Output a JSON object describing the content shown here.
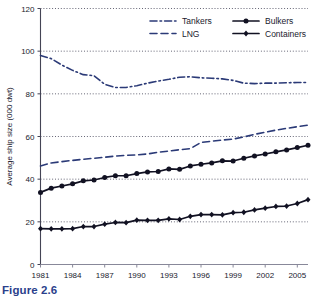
{
  "figure": {
    "caption": "Figure 2.6"
  },
  "chart_data": {
    "type": "line",
    "title": "",
    "subtitle": "",
    "xlabel": "",
    "ylabel": "Average ship size (000 dwt)",
    "ylim": [
      0,
      120
    ],
    "xlim": [
      1981,
      2006
    ],
    "y_ticks": [
      0,
      20,
      40,
      60,
      80,
      100,
      120
    ],
    "x_ticks": [
      1981,
      1984,
      1987,
      1990,
      1993,
      1996,
      1999,
      2002,
      2005
    ],
    "x_tick_labels": [
      "1981",
      "1984",
      "1987",
      "1990",
      "1993",
      "1996",
      "1999",
      "2002",
      "2005"
    ],
    "y_tick_labels": [
      "0",
      "20",
      "40",
      "60",
      "80",
      "100",
      "120"
    ],
    "grid": "horizontal-dotted",
    "legend_position": "top-right",
    "x": [
      1981,
      1982,
      1983,
      1984,
      1985,
      1986,
      1987,
      1988,
      1989,
      1990,
      1991,
      1992,
      1993,
      1994,
      1995,
      1996,
      1997,
      1998,
      1999,
      2000,
      2001,
      2002,
      2003,
      2004,
      2005,
      2006
    ],
    "series": [
      {
        "name": "Tankers",
        "color": "#2b3a77",
        "dash": "dashdot",
        "marker": "none",
        "values": [
          98.0,
          96.5,
          93.5,
          91.0,
          89.0,
          88.5,
          84.5,
          83.0,
          83.0,
          83.8,
          85.0,
          86.0,
          86.8,
          87.8,
          88.0,
          87.5,
          87.3,
          87.0,
          86.3,
          85.0,
          84.8,
          85.0,
          85.0,
          85.2,
          85.3,
          85.3
        ]
      },
      {
        "name": "LNG",
        "color": "#2b3a77",
        "dash": "dashed",
        "marker": "none",
        "values": [
          46.2,
          47.6,
          48.2,
          48.8,
          49.3,
          49.8,
          50.3,
          50.8,
          51.2,
          51.4,
          51.8,
          52.6,
          53.2,
          53.8,
          54.3,
          57.2,
          57.8,
          58.3,
          58.8,
          59.8,
          61.0,
          62.0,
          63.0,
          63.8,
          64.6,
          65.3
        ]
      },
      {
        "name": "Bulkers",
        "color": "#111122",
        "dash": "solid",
        "marker": "circle",
        "values": [
          33.8,
          35.8,
          36.8,
          37.8,
          39.2,
          39.6,
          40.8,
          41.6,
          41.6,
          42.6,
          43.4,
          43.6,
          44.8,
          44.6,
          46.2,
          47.0,
          47.6,
          48.6,
          48.5,
          49.8,
          50.9,
          51.8,
          52.8,
          53.7,
          54.8,
          55.9
        ]
      },
      {
        "name": "Containers",
        "color": "#111122",
        "dash": "solid",
        "marker": "diamond",
        "values": [
          16.8,
          16.7,
          16.7,
          16.8,
          17.8,
          17.8,
          18.9,
          19.7,
          19.6,
          20.8,
          20.7,
          20.7,
          21.4,
          21.1,
          22.6,
          23.4,
          23.4,
          23.3,
          24.3,
          24.5,
          25.6,
          26.4,
          27.2,
          27.4,
          28.6,
          30.4
        ]
      }
    ],
    "legend": [
      {
        "label": "Tankers",
        "color": "#2b3a77",
        "dash": "dashdot",
        "marker": "none"
      },
      {
        "label": "Bulkers",
        "color": "#111122",
        "dash": "solid",
        "marker": "circle"
      },
      {
        "label": "LNG",
        "color": "#2b3a77",
        "dash": "dashed",
        "marker": "none"
      },
      {
        "label": "Containers",
        "color": "#111122",
        "dash": "solid",
        "marker": "diamond"
      }
    ]
  }
}
